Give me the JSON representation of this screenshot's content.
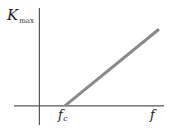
{
  "chart_data": {
    "type": "line",
    "title": "",
    "xlabel": "f",
    "ylabel": "K",
    "ylabel_subscript": "max",
    "x_tick_labels": [
      {
        "text": "f",
        "subscript": "c",
        "value": 1
      }
    ],
    "xlim": [
      -1,
      4.9
    ],
    "ylim": [
      -0.9,
      4.6
    ],
    "grid": false,
    "legend": null,
    "series": [
      {
        "name": "K_max vs f",
        "color": "#8a8a8a",
        "x": [
          1,
          4.7
        ],
        "y": [
          0,
          3.6
        ]
      }
    ],
    "axis_color": "#555555"
  }
}
